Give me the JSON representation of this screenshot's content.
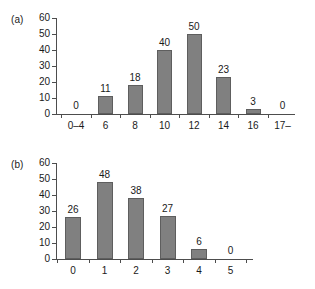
{
  "figure": {
    "background": "#ffffff",
    "bar_color": "#808080",
    "bar_edge_color": "#5e5e5e",
    "axis_color": "#4d4d4d"
  },
  "chart_data": [
    {
      "type": "bar",
      "panel": "(a)",
      "title": "",
      "xlabel": "",
      "ylabel": "",
      "categories": [
        "0–4",
        "6",
        "8",
        "10",
        "12",
        "14",
        "16",
        "17–"
      ],
      "values": [
        0,
        11,
        18,
        40,
        50,
        23,
        3,
        0
      ],
      "data_labels": [
        "0",
        "11",
        "18",
        "40",
        "50",
        "23",
        "3",
        "0"
      ],
      "yticks": [
        0,
        10,
        20,
        30,
        40,
        50,
        60
      ],
      "ytick_labels": [
        "0",
        "10",
        "20",
        "30",
        "40",
        "50",
        "60"
      ],
      "ylim": [
        0,
        60
      ],
      "grid": false,
      "legend": null
    },
    {
      "type": "bar",
      "panel": "(b)",
      "title": "",
      "xlabel": "",
      "ylabel": "",
      "categories": [
        "0",
        "1",
        "2",
        "3",
        "4",
        "5"
      ],
      "values": [
        26,
        48,
        38,
        27,
        6,
        0
      ],
      "data_labels": [
        "26",
        "48",
        "38",
        "27",
        "6",
        "0"
      ],
      "yticks": [
        0,
        10,
        20,
        30,
        40,
        50,
        60
      ],
      "ytick_labels": [
        "0",
        "10",
        "20",
        "30",
        "40",
        "50",
        "60"
      ],
      "ylim": [
        0,
        60
      ],
      "grid": false,
      "legend": null
    }
  ]
}
